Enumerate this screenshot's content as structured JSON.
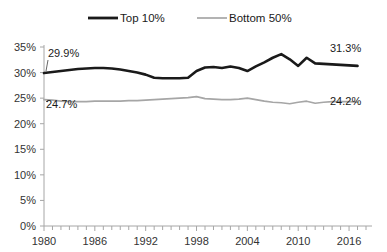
{
  "chart_data": {
    "type": "line",
    "title": "",
    "xlabel": "",
    "ylabel": "",
    "ylim": [
      0,
      35
    ],
    "xlim": [
      1980,
      2018
    ],
    "grid": false,
    "legend_position": "top-center",
    "ytick_labels": [
      "0%",
      "5%",
      "10%",
      "15%",
      "20%",
      "25%",
      "30%",
      "35%"
    ],
    "ytick_values": [
      0,
      5,
      10,
      15,
      20,
      25,
      30,
      35
    ],
    "xtick_labels": [
      "1980",
      "1986",
      "1992",
      "1998",
      "2004",
      "2010",
      "2016"
    ],
    "xtick_values": [
      1980,
      1986,
      1992,
      1998,
      2004,
      2010,
      2016
    ],
    "x": [
      1980,
      1981,
      1982,
      1983,
      1984,
      1985,
      1986,
      1987,
      1988,
      1989,
      1990,
      1991,
      1992,
      1993,
      1994,
      1995,
      1996,
      1997,
      1998,
      1999,
      2000,
      2001,
      2002,
      2003,
      2004,
      2005,
      2006,
      2007,
      2008,
      2009,
      2010,
      2011,
      2012,
      2013,
      2014,
      2015,
      2016,
      2017
    ],
    "series": [
      {
        "name": "Top 10%",
        "color": "#1a1a1a",
        "values": [
          29.9,
          30.1,
          30.3,
          30.5,
          30.7,
          30.8,
          30.9,
          30.9,
          30.8,
          30.6,
          30.3,
          30.0,
          29.6,
          29.0,
          28.9,
          28.9,
          28.9,
          29.0,
          30.3,
          31.0,
          31.1,
          30.9,
          31.2,
          30.9,
          30.3,
          31.2,
          32.0,
          32.9,
          33.6,
          32.6,
          31.3,
          32.9,
          31.8,
          31.7,
          31.6,
          31.5,
          31.4,
          31.3
        ]
      },
      {
        "name": "Bottom 50%",
        "color": "#a6a6a6",
        "values": [
          24.7,
          24.6,
          24.4,
          24.3,
          24.3,
          24.3,
          24.4,
          24.4,
          24.4,
          24.4,
          24.5,
          24.5,
          24.6,
          24.7,
          24.8,
          24.9,
          25.0,
          25.1,
          25.3,
          24.9,
          24.8,
          24.7,
          24.7,
          24.8,
          25.0,
          24.7,
          24.4,
          24.2,
          24.1,
          23.9,
          24.2,
          24.4,
          24.0,
          24.2,
          24.3,
          24.3,
          24.3,
          24.2
        ]
      }
    ],
    "annotations": [
      {
        "text": "29.9%",
        "series": "Top 10%",
        "at_x": 1980
      },
      {
        "text": "24.7%",
        "series": "Bottom 50%",
        "at_x": 1980
      },
      {
        "text": "31.3%",
        "series": "Top 10%",
        "at_x": 2017
      },
      {
        "text": "24.2%",
        "series": "Bottom 50%",
        "at_x": 2017
      }
    ]
  },
  "legend": {
    "items": [
      {
        "label": "Top 10%"
      },
      {
        "label": "Bottom 50%"
      }
    ]
  },
  "axes": {
    "y": {
      "labels": [
        "35%",
        "30%",
        "25%",
        "20%",
        "15%",
        "10%",
        "5%",
        "0%"
      ]
    },
    "x": {
      "labels": [
        "1980",
        "1986",
        "1992",
        "1998",
        "2004",
        "2010",
        "2016"
      ]
    }
  },
  "annotations": {
    "top_start": "29.9%",
    "bottom_start": "24.7%",
    "top_end": "31.3%",
    "bottom_end": "24.2%"
  }
}
